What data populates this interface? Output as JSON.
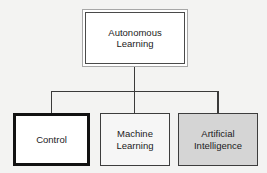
{
  "diagram": {
    "background_color": "#f3f3f2",
    "root": {
      "id": "autonomous-learning",
      "label": "Autonomous\nLearning",
      "fill_color": "#ffffff",
      "outer_border_color": "#a7a7a7",
      "inner_border_color": "#4a4a4a",
      "border_style": "double"
    },
    "children": [
      {
        "id": "control",
        "label": "Control",
        "fill_color": "#ffffff",
        "border_color": "#121212",
        "border_width_px": 3,
        "emphasis": "highlighted"
      },
      {
        "id": "machine-learning",
        "label": "Machine\nLearning",
        "fill_color": "#f6f6f6",
        "border_color": "#3d3d3d",
        "border_width_px": 1,
        "emphasis": "normal"
      },
      {
        "id": "artificial-intelligence",
        "label": "Artificial\nIntelligence",
        "fill_color": "#d5d5d5",
        "border_color": "#3d3d3d",
        "border_width_px": 1,
        "emphasis": "normal"
      }
    ],
    "connectors": {
      "line_color": "#3a3a3a",
      "line_width_px": 1.6,
      "style": "orthogonal-tree"
    }
  }
}
